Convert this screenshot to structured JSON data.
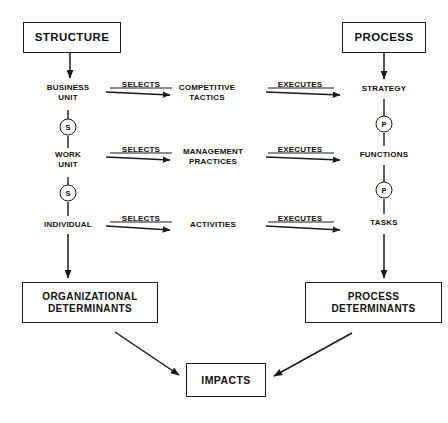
{
  "diagram": {
    "boxes": [
      {
        "id": "structure",
        "label": "STRUCTURE",
        "x": 23,
        "y": 22,
        "w": 98,
        "h": 31,
        "font_size": 11.5
      },
      {
        "id": "process",
        "label": "PROCESS",
        "x": 342,
        "y": 22,
        "w": 84,
        "h": 31,
        "font_size": 11.5
      },
      {
        "id": "organizational-determinants",
        "label": "ORGANIZATIONAL\nDETERMINANTS",
        "x": 22,
        "y": 282,
        "w": 136,
        "h": 41,
        "font_size": 10
      },
      {
        "id": "process-determinants",
        "label": "PROCESS\nDETERMINANTS",
        "x": 305,
        "y": 282,
        "w": 137,
        "h": 41,
        "font_size": 10
      },
      {
        "id": "impacts",
        "label": "IMPACTS",
        "x": 186,
        "y": 363,
        "w": 80,
        "h": 34,
        "font_size": 10.5
      }
    ],
    "nodes": [
      {
        "id": "business-unit",
        "label": "BUSINESS\nUNIT",
        "x": 68,
        "y": 93,
        "font_size": 8
      },
      {
        "id": "work-unit",
        "label": "WORK\nUNIT",
        "x": 68,
        "y": 160,
        "font_size": 8
      },
      {
        "id": "individual",
        "label": "INDIVIDUAL",
        "x": 68,
        "y": 225,
        "font_size": 8
      },
      {
        "id": "competitive-tactics",
        "label": "COMPETITIVE\nTACTICS",
        "x": 207,
        "y": 93,
        "font_size": 8
      },
      {
        "id": "management-practices",
        "label": "MANAGEMENT\nPRACTICES",
        "x": 213,
        "y": 157,
        "font_size": 8
      },
      {
        "id": "activities",
        "label": "ACTIVITIES",
        "x": 213,
        "y": 225,
        "font_size": 8
      },
      {
        "id": "strategy",
        "label": "STRATEGY",
        "x": 384,
        "y": 89,
        "font_size": 8
      },
      {
        "id": "functions",
        "label": "FUNCTIONS",
        "x": 384,
        "y": 155,
        "font_size": 8
      },
      {
        "id": "tasks",
        "label": "TASKS",
        "x": 384,
        "y": 223,
        "font_size": 8
      }
    ],
    "circles": [
      {
        "id": "selects-link-business-work",
        "label": "S",
        "x": 68,
        "y": 127,
        "d": 17,
        "font_size": 7.5
      },
      {
        "id": "selects-link-work-individual",
        "label": "S",
        "x": 68,
        "y": 193,
        "d": 17,
        "font_size": 7.5
      },
      {
        "id": "process-link-strategy-functions",
        "label": "P",
        "x": 384,
        "y": 124,
        "d": 17,
        "font_size": 7.5
      },
      {
        "id": "process-link-functions-tasks",
        "label": "P",
        "x": 384,
        "y": 190,
        "d": 17,
        "font_size": 7.5
      }
    ],
    "edge_labels": [
      {
        "id": "selects-1",
        "label": "SELECTS",
        "x": 141,
        "y": 84,
        "font_size": 8
      },
      {
        "id": "executes-1",
        "label": "EXECUTES",
        "x": 300,
        "y": 84,
        "font_size": 8
      },
      {
        "id": "selects-2",
        "label": "SELECTS",
        "x": 141,
        "y": 149,
        "font_size": 8
      },
      {
        "id": "executes-2",
        "label": "EXECUTES",
        "x": 300,
        "y": 149,
        "font_size": 8
      },
      {
        "id": "selects-3",
        "label": "SELECTS",
        "x": 141,
        "y": 218,
        "font_size": 8
      },
      {
        "id": "executes-3",
        "label": "EXECUTES",
        "x": 300,
        "y": 218,
        "font_size": 8
      }
    ],
    "colors": {
      "stroke": "#1a1a1a",
      "text": "#111111",
      "background": "#ffffff"
    }
  }
}
